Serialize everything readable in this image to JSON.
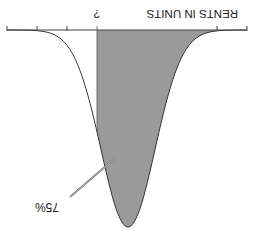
{
  "diagram": {
    "type": "normal-distribution-curve",
    "orientation": "rotated-180",
    "axis_label": "RENTS IN UNITS",
    "cutoff_label": "?",
    "shaded_percent_label": "75%",
    "shaded_region": "right of cutoff (upper 75% of distribution)",
    "colors": {
      "background": "#ffffff",
      "curve": "#333333",
      "shading": "#9a9a9a",
      "axis": "#444444",
      "text": "#222222"
    },
    "geometry": {
      "baseline_y": 30,
      "axis_x_start": 7,
      "axis_x_end": 247,
      "peak_x": 128,
      "peak_y": 227,
      "sigma_px": 27,
      "cutoff_x": 97,
      "tick_x": [
        7,
        37,
        67,
        217,
        247
      ],
      "pointer": {
        "x1": 70,
        "y1": 197,
        "x2": 114,
        "y2": 159
      }
    }
  }
}
